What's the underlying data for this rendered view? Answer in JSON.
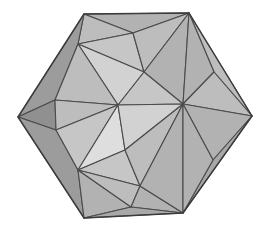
{
  "canvas": {
    "width": 261,
    "height": 228,
    "background": "#ffffff"
  },
  "figure": {
    "name": "polyhedron-wireframe",
    "kind": "3d-polyhedron-shaded-render",
    "silhouette": "hexagon",
    "edge_color": "#4b4b4b",
    "outline_color": "#3c3c3c",
    "palette": {
      "highlight": "#dedede",
      "bright": "#d2d2d2",
      "light": "#c6c6c6",
      "mid_light": "#bdbdbd",
      "mid": "#b2b2b2",
      "mid_dark": "#a8a8a8",
      "dark": "#9c9c9c",
      "darkest": "#909090"
    },
    "vertices": {
      "hex_top_left": [
        84,
        14
      ],
      "hex_top_right": [
        189,
        13
      ],
      "hex_right": [
        252,
        116
      ],
      "hex_bottom_right": [
        183,
        213
      ],
      "hex_bottom_left": [
        84,
        218
      ],
      "hex_left": [
        18,
        117
      ],
      "hub_upper_left": [
        78,
        44
      ],
      "hub_lower_left": [
        78,
        170
      ],
      "hub_right": [
        183,
        104
      ],
      "star_inner_upper": [
        118,
        105
      ],
      "star_inner_lower": [
        125,
        150
      ],
      "ridge_upper_mid": [
        144,
        72
      ],
      "ridge_lower_mid": [
        140,
        186
      ],
      "left_mid_upper": [
        55,
        100
      ],
      "left_mid_lower": [
        56,
        130
      ],
      "top_mid": [
        133,
        33
      ],
      "bottom_mid": [
        131,
        207
      ],
      "right_upper_fan": [
        214,
        72
      ],
      "right_lower_fan": [
        213,
        160
      ]
    },
    "faces": [
      {
        "name": "top-left-outer-upper",
        "shade": "mid",
        "points": "84,14 189,13 133,33"
      },
      {
        "name": "top-left-outer-lower",
        "shade": "mid_light",
        "points": "84,14 133,33 78,44"
      },
      {
        "name": "top-wedge-left",
        "shade": "light",
        "points": "133,33 144,72 78,44"
      },
      {
        "name": "top-wedge-right",
        "shade": "mid_light",
        "points": "133,33 189,13 144,72"
      },
      {
        "name": "upper-ridge-right",
        "shade": "mid",
        "points": "189,13 183,104 144,72"
      },
      {
        "name": "upper-inner-fan",
        "shade": "bright",
        "points": "78,44 144,72 118,105"
      },
      {
        "name": "upper-inner-fan-b",
        "shade": "light",
        "points": "144,72 183,104 118,105"
      },
      {
        "name": "left-upper-panel",
        "shade": "dark",
        "points": "84,14 78,44 55,100 18,117"
      },
      {
        "name": "left-mid-panel",
        "shade": "darkest",
        "points": "18,117 55,100 56,130"
      },
      {
        "name": "left-lower-panel",
        "shade": "dark",
        "points": "18,117 56,130 78,170 84,218"
      },
      {
        "name": "inner-left-upper",
        "shade": "mid_light",
        "points": "78,44 55,100 118,105"
      },
      {
        "name": "inner-left-mid",
        "shade": "mid_light",
        "points": "55,100 56,130 118,105"
      },
      {
        "name": "inner-left-lower",
        "shade": "light",
        "points": "56,130 78,170 118,105"
      },
      {
        "name": "star-core-lower",
        "shade": "highlight",
        "points": "118,105 78,170 125,150"
      },
      {
        "name": "star-core-right",
        "shade": "bright",
        "points": "118,105 125,150 183,104"
      },
      {
        "name": "lower-inner-wedge",
        "shade": "light",
        "points": "125,150 78,170 140,186"
      },
      {
        "name": "lower-inner-wedge-b",
        "shade": "mid_light",
        "points": "125,150 140,186 183,104"
      },
      {
        "name": "bottom-left-fan",
        "shade": "mid",
        "points": "78,170 84,218 131,207"
      },
      {
        "name": "bottom-mid-fan",
        "shade": "mid_light",
        "points": "78,170 131,207 140,186"
      },
      {
        "name": "bottom-right-fan",
        "shade": "mid",
        "points": "131,207 183,213 140,186"
      },
      {
        "name": "bottom-outer-strip",
        "shade": "mid_dark",
        "points": "84,218 183,213 131,207"
      },
      {
        "name": "lower-ridge-right",
        "shade": "mid",
        "points": "140,186 183,213 183,104"
      },
      {
        "name": "right-upper-blade-1",
        "shade": "mid_light",
        "points": "189,13 252,116 214,72"
      },
      {
        "name": "right-upper-blade-2",
        "shade": "mid",
        "points": "189,13 214,72 183,104"
      },
      {
        "name": "right-upper-blade-3",
        "shade": "mid_light",
        "points": "214,72 252,116 183,104"
      },
      {
        "name": "right-lower-blade-1",
        "shade": "mid",
        "points": "183,104 252,116 213,160"
      },
      {
        "name": "right-lower-blade-2",
        "shade": "mid_dark",
        "points": "252,116 183,213 213,160"
      },
      {
        "name": "right-lower-blade-3",
        "shade": "mid",
        "points": "183,104 213,160 183,213"
      }
    ],
    "silhouette_path": "84,14 189,13 252,116 183,213 84,218 18,117"
  }
}
